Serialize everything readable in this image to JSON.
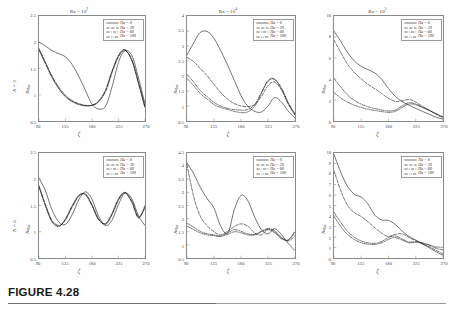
{
  "figure": {
    "caption_label": "FIGURE 4.28",
    "x_axis_label": "ζ",
    "y_axis_label_base": "Nu",
    "y_axis_label_sub": "loc",
    "row_labels": [
      "N = 3",
      "N = 6"
    ],
    "legend_entries": [
      {
        "label": "Ha = 0",
        "style": "solid",
        "color": "#1a1a1a"
      },
      {
        "label": "Ha = 20",
        "style": "dashed",
        "color": "#1a1a1a"
      },
      {
        "label": "Ha = 60",
        "style": "dashdot",
        "color": "#1a1a1a"
      },
      {
        "label": "Ha = 100",
        "style": "dashdotdot",
        "color": "#1a1a1a"
      }
    ],
    "xticks": [
      "90",
      "135",
      "180",
      "225",
      "270"
    ]
  },
  "chart_data": [
    {
      "type": "line",
      "panel_id": "N3-Ra1e3",
      "title": "Ra = 10³",
      "title_base": "Ra = 10",
      "title_exp": "3",
      "row": "N = 3",
      "xlabel": "ζ",
      "ylabel": "Nu_loc",
      "xlim": [
        90,
        270
      ],
      "ylim": [
        0.5,
        2.5
      ],
      "yticks": [
        "2.5",
        "2",
        "1.5",
        "1",
        "0.5"
      ],
      "ytick_values": [
        2.5,
        2.0,
        1.5,
        1.0,
        0.5
      ],
      "xticks": [
        90,
        135,
        180,
        225,
        270
      ],
      "grid": false,
      "legend_position": "top-right",
      "x": [
        90,
        101,
        112,
        124,
        135,
        146,
        158,
        169,
        180,
        191,
        203,
        214,
        225,
        236,
        248,
        259,
        270
      ],
      "series": [
        {
          "name": "Ha = 0",
          "values": [
            2.0,
            1.93,
            1.84,
            1.78,
            1.72,
            1.58,
            1.34,
            1.08,
            0.82,
            0.73,
            0.78,
            1.15,
            1.62,
            1.84,
            1.74,
            1.32,
            0.82
          ]
        },
        {
          "name": "Ha = 20",
          "values": [
            1.88,
            1.62,
            1.36,
            1.14,
            0.99,
            0.89,
            0.83,
            0.8,
            0.8,
            0.86,
            1.06,
            1.42,
            1.72,
            1.84,
            1.66,
            1.24,
            0.78
          ]
        },
        {
          "name": "Ha = 60",
          "values": [
            1.86,
            1.6,
            1.34,
            1.12,
            0.97,
            0.88,
            0.82,
            0.79,
            0.8,
            0.87,
            1.08,
            1.44,
            1.74,
            1.85,
            1.65,
            1.22,
            0.76
          ]
        },
        {
          "name": "Ha = 100",
          "values": [
            1.85,
            1.59,
            1.33,
            1.11,
            0.96,
            0.87,
            0.81,
            0.79,
            0.8,
            0.88,
            1.09,
            1.45,
            1.75,
            1.86,
            1.64,
            1.21,
            0.75
          ]
        }
      ]
    },
    {
      "type": "line",
      "panel_id": "N3-Ra1e4",
      "title": "Ra = 10⁴",
      "title_base": "Ra = 10",
      "title_exp": "4",
      "row": "N = 3",
      "xlabel": "ζ",
      "ylabel": "Nu_loc",
      "xlim": [
        90,
        270
      ],
      "ylim": [
        0.5,
        4.0
      ],
      "yticks": [
        "4",
        "3.5",
        "3",
        "2.5",
        "2",
        "1.5",
        "1",
        "0.5"
      ],
      "ytick_values": [
        4.0,
        3.5,
        3.0,
        2.5,
        2.0,
        1.5,
        1.0,
        0.5
      ],
      "xticks": [
        90,
        135,
        180,
        225,
        270
      ],
      "grid": false,
      "legend_position": "top-right",
      "x": [
        90,
        101,
        112,
        124,
        135,
        146,
        158,
        169,
        180,
        191,
        203,
        214,
        225,
        236,
        248,
        259,
        270
      ],
      "series": [
        {
          "name": "Ha = 0",
          "values": [
            2.7,
            3.1,
            3.45,
            3.48,
            3.25,
            2.85,
            2.35,
            1.85,
            1.35,
            1.0,
            0.82,
            0.8,
            1.0,
            1.28,
            1.12,
            0.82,
            0.6
          ]
        },
        {
          "name": "Ha = 20",
          "values": [
            2.62,
            2.48,
            2.25,
            2.0,
            1.72,
            1.45,
            1.22,
            1.08,
            1.0,
            0.98,
            1.05,
            1.32,
            1.68,
            1.8,
            1.52,
            1.05,
            0.7
          ]
        },
        {
          "name": "Ha = 60",
          "values": [
            2.05,
            1.8,
            1.52,
            1.3,
            1.12,
            1.0,
            0.92,
            0.88,
            0.86,
            0.88,
            1.05,
            1.45,
            1.82,
            1.88,
            1.55,
            1.08,
            0.72
          ]
        },
        {
          "name": "Ha = 100",
          "values": [
            1.92,
            1.68,
            1.42,
            1.22,
            1.05,
            0.95,
            0.88,
            0.82,
            0.78,
            0.8,
            1.0,
            1.42,
            1.85,
            1.9,
            1.58,
            1.1,
            0.74
          ]
        }
      ]
    },
    {
      "type": "line",
      "panel_id": "N3-Ra1e5",
      "title": "Ra = 10⁵",
      "title_base": "Ra = 10",
      "title_exp": "5",
      "row": "N = 3",
      "xlabel": "ζ",
      "ylabel": "Nu_loc",
      "xlim": [
        90,
        270
      ],
      "ylim": [
        0,
        10
      ],
      "yticks": [
        "10",
        "8",
        "6",
        "4",
        "2",
        "0"
      ],
      "ytick_values": [
        10,
        8,
        6,
        4,
        2,
        0
      ],
      "xticks": [
        90,
        135,
        180,
        225,
        270
      ],
      "grid": false,
      "legend_position": "top-right",
      "x": [
        90,
        101,
        112,
        124,
        135,
        146,
        158,
        169,
        180,
        191,
        203,
        214,
        225,
        236,
        248,
        259,
        270
      ],
      "series": [
        {
          "name": "Ha = 0",
          "values": [
            8.55,
            7.6,
            6.55,
            5.7,
            5.2,
            4.9,
            4.55,
            3.95,
            3.1,
            2.35,
            1.85,
            1.5,
            1.2,
            0.92,
            0.62,
            0.36,
            0.18
          ]
        },
        {
          "name": "Ha = 20",
          "values": [
            7.7,
            6.55,
            5.45,
            4.6,
            4.0,
            3.5,
            3.05,
            2.6,
            2.15,
            1.88,
            1.92,
            2.05,
            1.8,
            1.4,
            1.0,
            0.62,
            0.3
          ]
        },
        {
          "name": "Ha = 60",
          "values": [
            4.05,
            3.25,
            2.5,
            1.95,
            1.6,
            1.35,
            1.18,
            1.05,
            0.95,
            1.05,
            1.45,
            1.75,
            1.62,
            1.32,
            1.0,
            0.68,
            0.38
          ]
        },
        {
          "name": "Ha = 100",
          "values": [
            2.7,
            2.2,
            1.8,
            1.5,
            1.28,
            1.12,
            1.0,
            0.9,
            0.82,
            0.92,
            1.3,
            1.62,
            1.55,
            1.28,
            0.98,
            0.68,
            0.4
          ]
        }
      ]
    },
    {
      "type": "line",
      "panel_id": "N6-Ra1e3",
      "title": "",
      "title_base": "",
      "title_exp": "",
      "row": "N = 6",
      "xlabel": "ζ",
      "ylabel": "Nu_loc",
      "xlim": [
        90,
        270
      ],
      "ylim": [
        0.5,
        2.5
      ],
      "yticks": [
        "2.5",
        "2",
        "1.5",
        "1",
        "0.5"
      ],
      "ytick_values": [
        2.5,
        2.0,
        1.5,
        1.0,
        0.5
      ],
      "xticks": [
        90,
        135,
        180,
        225,
        270
      ],
      "grid": false,
      "legend_position": "top-right",
      "x": [
        90,
        101,
        112,
        124,
        135,
        146,
        158,
        169,
        180,
        191,
        203,
        214,
        225,
        236,
        248,
        259,
        270
      ],
      "series": [
        {
          "name": "Ha = 0",
          "values": [
            2.02,
            1.78,
            1.42,
            1.18,
            1.14,
            1.32,
            1.62,
            1.76,
            1.62,
            1.3,
            1.12,
            1.22,
            1.52,
            1.74,
            1.62,
            1.3,
            1.12
          ]
        },
        {
          "name": "Ha = 20",
          "values": [
            1.88,
            1.52,
            1.22,
            1.12,
            1.22,
            1.46,
            1.68,
            1.72,
            1.52,
            1.25,
            1.14,
            1.32,
            1.6,
            1.74,
            1.58,
            1.28,
            1.45
          ]
        },
        {
          "name": "Ha = 60",
          "values": [
            1.86,
            1.5,
            1.2,
            1.11,
            1.24,
            1.48,
            1.69,
            1.71,
            1.5,
            1.24,
            1.15,
            1.34,
            1.62,
            1.74,
            1.56,
            1.27,
            1.48
          ]
        },
        {
          "name": "Ha = 100",
          "values": [
            1.85,
            1.49,
            1.19,
            1.1,
            1.25,
            1.49,
            1.7,
            1.7,
            1.49,
            1.23,
            1.16,
            1.35,
            1.63,
            1.75,
            1.55,
            1.26,
            1.5
          ]
        }
      ]
    },
    {
      "type": "line",
      "panel_id": "N6-Ra1e4",
      "title": "",
      "title_base": "",
      "title_exp": "",
      "row": "N = 6",
      "xlabel": "ζ",
      "ylabel": "Nu_loc",
      "xlim": [
        90,
        270
      ],
      "ylim": [
        0.5,
        4.5
      ],
      "yticks": [
        "4.5",
        "4",
        "3.5",
        "3",
        "2.5",
        "2",
        "1.5",
        "1",
        "0.5"
      ],
      "ytick_values": [
        4.5,
        4.0,
        3.5,
        3.0,
        2.5,
        2.0,
        1.5,
        1.0,
        0.5
      ],
      "xticks": [
        90,
        135,
        180,
        225,
        270
      ],
      "grid": false,
      "legend_position": "top-right",
      "x": [
        90,
        101,
        112,
        124,
        135,
        146,
        158,
        169,
        180,
        191,
        203,
        214,
        225,
        236,
        248,
        259,
        270
      ],
      "series": [
        {
          "name": "Ha = 0",
          "values": [
            4.12,
            3.72,
            3.2,
            2.75,
            2.4,
            1.72,
            1.45,
            2.35,
            2.88,
            2.7,
            2.05,
            1.58,
            1.42,
            1.62,
            1.38,
            1.05,
            0.78
          ]
        },
        {
          "name": "Ha = 20",
          "values": [
            4.05,
            2.85,
            2.1,
            1.72,
            1.5,
            1.38,
            1.52,
            1.7,
            1.8,
            1.72,
            1.45,
            1.38,
            1.6,
            1.55,
            1.28,
            1.15,
            1.35
          ]
        },
        {
          "name": "Ha = 60",
          "values": [
            1.82,
            1.68,
            1.52,
            1.42,
            1.38,
            1.34,
            1.46,
            1.58,
            1.52,
            1.42,
            1.4,
            1.52,
            1.62,
            1.5,
            1.25,
            1.18,
            1.48
          ]
        },
        {
          "name": "Ha = 100",
          "values": [
            1.72,
            1.58,
            1.46,
            1.38,
            1.35,
            1.32,
            1.4,
            1.5,
            1.46,
            1.38,
            1.38,
            1.5,
            1.58,
            1.46,
            1.22,
            1.2,
            1.52
          ]
        }
      ]
    },
    {
      "type": "line",
      "panel_id": "N6-Ra1e5",
      "title": "",
      "title_base": "",
      "title_exp": "",
      "row": "N = 6",
      "xlabel": "ζ",
      "ylabel": "Nu_loc",
      "xlim": [
        0,
        10
      ],
      "ylim": [
        0,
        10
      ],
      "yticks": [
        "10",
        "9",
        "8",
        "7",
        "6",
        "5",
        "4",
        "3",
        "2",
        "1",
        "0"
      ],
      "ytick_values": [
        10,
        9,
        8,
        7,
        6,
        5,
        4,
        3,
        2,
        1,
        0
      ],
      "xticks": [
        90,
        135,
        180,
        225,
        270
      ],
      "grid": false,
      "legend_position": "top-right",
      "x": [
        90,
        101,
        112,
        124,
        135,
        146,
        158,
        169,
        180,
        191,
        203,
        214,
        225,
        236,
        248,
        259,
        270
      ],
      "series": [
        {
          "name": "Ha = 0",
          "values": [
            9.85,
            8.2,
            6.85,
            6.05,
            5.8,
            5.15,
            4.05,
            3.62,
            3.58,
            3.2,
            2.55,
            2.05,
            1.72,
            1.35,
            0.95,
            0.58,
            0.25
          ]
        },
        {
          "name": "Ha = 20",
          "values": [
            8.3,
            6.45,
            5.05,
            4.3,
            3.95,
            3.45,
            2.85,
            2.35,
            2.05,
            2.25,
            2.3,
            1.95,
            1.65,
            1.35,
            1.05,
            0.72,
            0.4
          ]
        },
        {
          "name": "Ha = 60",
          "values": [
            4.35,
            3.4,
            2.55,
            1.95,
            1.62,
            1.45,
            1.4,
            1.58,
            1.95,
            2.1,
            1.8,
            1.52,
            1.55,
            1.42,
            1.18,
            0.92,
            0.78
          ]
        },
        {
          "name": "Ha = 100",
          "values": [
            3.95,
            3.0,
            2.25,
            1.75,
            1.45,
            1.32,
            1.3,
            1.45,
            1.78,
            1.95,
            1.7,
            1.45,
            1.5,
            1.42,
            1.25,
            1.05,
            1.02
          ]
        }
      ]
    }
  ]
}
